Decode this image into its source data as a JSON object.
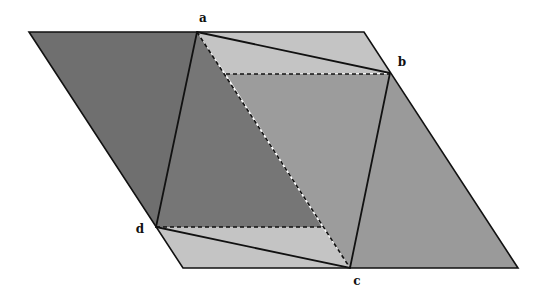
{
  "diagram": {
    "colors": {
      "stroke": "#111111",
      "dark_left": "#6f6f6f",
      "inner_left_triangle": "#777777",
      "light_strip": "#c4c4c4",
      "middle_right": "#9c9c9c",
      "right_region": "#9a9a9a"
    },
    "outer_parallelogram": {
      "top_left": [
        29,
        32
      ],
      "top_right": [
        364,
        32
      ],
      "bottom_right": [
        518,
        268
      ],
      "bottom_left": [
        183,
        268
      ]
    },
    "vertices": {
      "a": {
        "label": "a",
        "point": [
          197,
          32
        ],
        "label_pos": [
          203,
          22
        ]
      },
      "b": {
        "label": "b",
        "point": [
          390,
          73
        ],
        "label_pos": [
          400,
          66
        ]
      },
      "c": {
        "label": "c",
        "point": [
          350,
          268
        ],
        "label_pos": [
          357,
          285
        ]
      },
      "d": {
        "label": "d",
        "point": [
          156,
          227
        ],
        "label_pos": [
          136,
          233
        ]
      }
    },
    "dashed_lines": [
      {
        "name": "diagonal-a-c",
        "from": [
          197,
          32
        ],
        "to": [
          350,
          268
        ]
      },
      {
        "name": "upper-horizontal",
        "from": [
          226,
          74
        ],
        "to": [
          390,
          74
        ]
      },
      {
        "name": "lower-horizontal",
        "from": [
          156,
          227
        ],
        "to": [
          322,
          227
        ]
      }
    ]
  }
}
